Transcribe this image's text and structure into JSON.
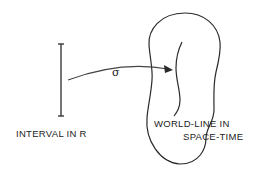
{
  "diagram": {
    "interval_label": "INTERVAL IN R",
    "map_label": "σ",
    "worldline_label_line1": "WORLD-LINE IN",
    "worldline_label_line2": "SPACE-TIME",
    "stroke_color": "#2a2a2a"
  }
}
